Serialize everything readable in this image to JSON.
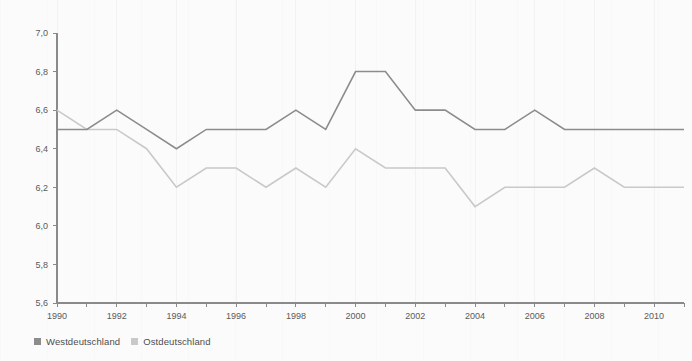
{
  "chart_data": {
    "type": "line",
    "title": "",
    "subtitle": "",
    "xlabel": "",
    "ylabel": "",
    "xlim": [
      1990,
      2011
    ],
    "ylim": [
      5.6,
      7.0
    ],
    "yticks": [
      "5,6",
      "5,8",
      "6,0",
      "6,2",
      "6,4",
      "6,6",
      "6,8",
      "7,0"
    ],
    "ytick_values": [
      5.6,
      5.8,
      6.0,
      6.2,
      6.4,
      6.6,
      6.8,
      7.0
    ],
    "xticks": [
      "1990",
      "1992",
      "1994",
      "1996",
      "1998",
      "2000",
      "2002",
      "2004",
      "2006",
      "2008",
      "2010"
    ],
    "xtick_values": [
      1990,
      1992,
      1994,
      1996,
      1998,
      2000,
      2002,
      2004,
      2006,
      2008,
      2010
    ],
    "x": [
      1990,
      1991,
      1992,
      1993,
      1994,
      1995,
      1996,
      1997,
      1998,
      1999,
      2000,
      2001,
      2002,
      2003,
      2004,
      2005,
      2006,
      2007,
      2008,
      2009,
      2010,
      2011
    ],
    "grid": "vertical-faint",
    "legend_position": "bottom-left",
    "series": [
      {
        "name": "Westdeutschland",
        "color": "#8c8c8c",
        "values": [
          6.5,
          6.5,
          6.6,
          6.5,
          6.4,
          6.5,
          6.5,
          6.5,
          6.6,
          6.5,
          6.8,
          6.8,
          6.6,
          6.6,
          6.5,
          6.5,
          6.6,
          6.5,
          6.5,
          6.5,
          6.5,
          6.5
        ]
      },
      {
        "name": "Ostdeutschland",
        "color": "#c9c9c9",
        "values": [
          6.6,
          6.5,
          6.5,
          6.4,
          6.2,
          6.3,
          6.3,
          6.2,
          6.3,
          6.2,
          6.4,
          6.3,
          6.3,
          6.3,
          6.1,
          6.2,
          6.2,
          6.2,
          6.3,
          6.2,
          6.2,
          6.2
        ]
      }
    ]
  },
  "legend": {
    "items": [
      {
        "label": "Westdeutschland",
        "color": "#8c8c8c"
      },
      {
        "label": "Ostdeutschland",
        "color": "#c9c9c9"
      }
    ]
  },
  "colors": {
    "background": "#fbfbfb",
    "axis": "#8a8a8a",
    "tick_text": "#5a5a5a",
    "west": "#8c8c8c",
    "ost": "#c9c9c9"
  }
}
